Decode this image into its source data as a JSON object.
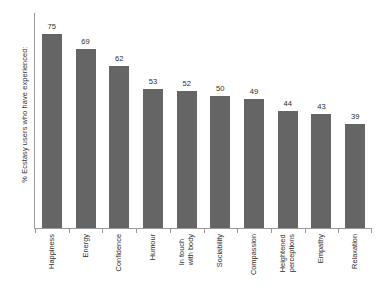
{
  "chart_data": {
    "type": "bar",
    "title": "",
    "subtitle": "",
    "xlabel": "",
    "ylabel": "% Ecstasy users who have experienced:",
    "ylim": [
      0,
      80
    ],
    "grid": false,
    "legend": null,
    "orientation": "vertical",
    "bar_color": "#656565",
    "axis_color": "#9a9a9a",
    "categories": [
      "Happiness",
      "Energy",
      "Confidence",
      "Humour",
      "In touch with body",
      "Sociability",
      "Compassion",
      "Heightened perceptions",
      "Empathy",
      "Relaxation"
    ],
    "category_lines": [
      [
        "Happiness"
      ],
      [
        "Energy"
      ],
      [
        "Confidence"
      ],
      [
        "Humour"
      ],
      [
        "In touch",
        "with body"
      ],
      [
        "Sociability"
      ],
      [
        "Compassion"
      ],
      [
        "Heightened",
        "perceptions"
      ],
      [
        "Empathy"
      ],
      [
        "Relaxation"
      ]
    ],
    "values": [
      75,
      69,
      62,
      53,
      52,
      50,
      49,
      44,
      43,
      39
    ],
    "value_labels": [
      "75",
      "69",
      "62",
      "53",
      "52",
      "50",
      "49",
      "44",
      "43",
      "39"
    ]
  }
}
